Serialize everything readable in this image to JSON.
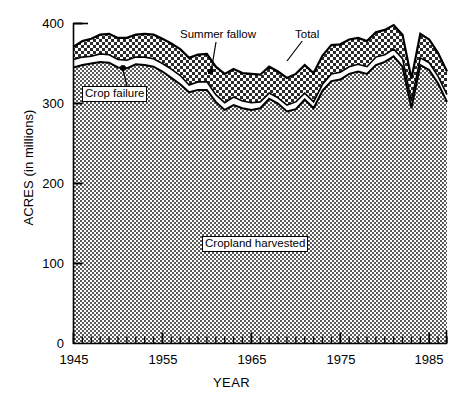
{
  "chart_data": {
    "type": "area",
    "subtype": "stacked-area",
    "title": "",
    "xlabel": "YEAR",
    "ylabel": "ACRES (in millions)",
    "xlim": [
      1945,
      1987
    ],
    "ylim": [
      0,
      400
    ],
    "yticks": [
      0,
      100,
      200,
      300,
      400
    ],
    "ytick_labels": [
      "0",
      "100",
      "200",
      "300",
      "400"
    ],
    "xticks": [
      1945,
      1955,
      1965,
      1975,
      1985
    ],
    "xtick_labels": [
      "1945",
      "1955",
      "1965",
      "1975",
      "1985"
    ],
    "xtick_minor_interval": 1,
    "grid": false,
    "legend_position": "inline-annotations",
    "annotations": [
      {
        "label": "Summer fallow",
        "style": "plain-white-box",
        "points_to": "middle band"
      },
      {
        "label": "Total",
        "style": "plain-white-box",
        "points_to": "top curve"
      },
      {
        "label": "Crop failure",
        "style": "boxed",
        "points_to": "thin white band"
      },
      {
        "label": "Cropland harvested",
        "style": "boxed",
        "points_to": "bottom filled area"
      }
    ],
    "x": [
      1945,
      1946,
      1947,
      1948,
      1949,
      1950,
      1951,
      1952,
      1953,
      1954,
      1955,
      1956,
      1957,
      1958,
      1959,
      1960,
      1961,
      1962,
      1963,
      1964,
      1965,
      1966,
      1967,
      1968,
      1969,
      1970,
      1971,
      1972,
      1973,
      1974,
      1975,
      1976,
      1977,
      1978,
      1979,
      1980,
      1981,
      1982,
      1983,
      1984,
      1985,
      1986,
      1987
    ],
    "series": [
      {
        "name": "Cropland harvested",
        "fill": "medium-gray-checker",
        "values": [
          345,
          348,
          350,
          352,
          351,
          345,
          344,
          349,
          348,
          346,
          340,
          332,
          324,
          314,
          317,
          317,
          302,
          292,
          298,
          294,
          292,
          294,
          306,
          300,
          290,
          293,
          305,
          294,
          316,
          328,
          330,
          337,
          340,
          337,
          348,
          352,
          359,
          346,
          294,
          348,
          342,
          325,
          302
        ]
      },
      {
        "name": "Crop failure",
        "fill": "white",
        "values": [
          10,
          10,
          9,
          10,
          10,
          10,
          10,
          9,
          10,
          10,
          10,
          11,
          11,
          9,
          10,
          10,
          9,
          9,
          10,
          9,
          9,
          8,
          7,
          7,
          8,
          9,
          8,
          8,
          8,
          9,
          9,
          9,
          9,
          9,
          10,
          9,
          9,
          10,
          9,
          9,
          9,
          9,
          9
        ]
      },
      {
        "name": "Summer fallow",
        "fill": "coarse-dot-checker",
        "values": [
          16,
          20,
          22,
          24,
          26,
          27,
          28,
          28,
          29,
          30,
          31,
          32,
          33,
          34,
          34,
          35,
          35,
          36,
          35,
          35,
          36,
          34,
          33,
          33,
          34,
          35,
          35,
          36,
          36,
          36,
          35,
          34,
          33,
          32,
          31,
          31,
          30,
          30,
          28,
          30,
          29,
          29,
          29
        ]
      }
    ],
    "totals": [
      371,
      378,
      381,
      386,
      387,
      382,
      382,
      386,
      387,
      386,
      381,
      375,
      368,
      357,
      361,
      362,
      346,
      337,
      343,
      338,
      337,
      336,
      346,
      340,
      332,
      337,
      348,
      338,
      360,
      373,
      374,
      380,
      382,
      378,
      389,
      392,
      398,
      386,
      331,
      387,
      380,
      363,
      340
    ]
  }
}
